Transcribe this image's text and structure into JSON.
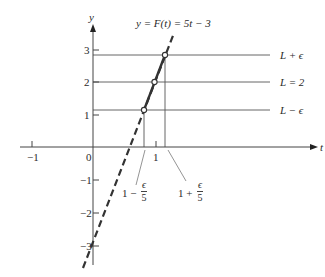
{
  "figure": {
    "function_label": "y = F(t) = 5t − 3",
    "axes": {
      "x_axis_label": "t",
      "y_axis_label": "y",
      "x_ticks": [
        "−1",
        "0",
        "1"
      ],
      "y_ticks": [
        "3",
        "2",
        "1",
        "−1",
        "−2",
        "−3"
      ]
    },
    "horizontal_lines": {
      "upper": "L + ϵ",
      "middle": "L = 2",
      "lower": "L − ϵ"
    },
    "interval_labels": {
      "left": {
        "prefix": "1 −",
        "numerator": "ϵ",
        "denominator": "5"
      },
      "right": {
        "prefix": "1 +",
        "numerator": "ϵ",
        "denominator": "5"
      }
    },
    "colors": {
      "line": "#333333",
      "guide_lines": "#555555",
      "background": "#ffffff"
    }
  }
}
